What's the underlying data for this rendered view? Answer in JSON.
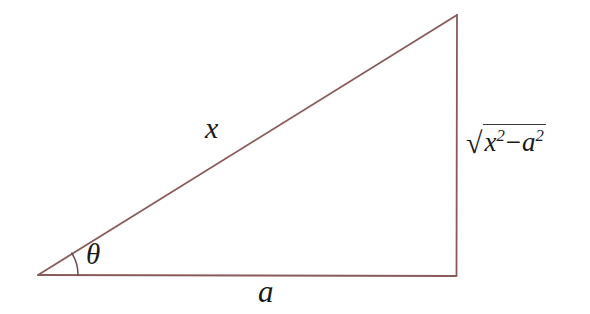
{
  "figure": {
    "name": "right-triangle-trig-substitution",
    "background_color": "#ffffff",
    "line_color": "#8a5a5a",
    "text_color": "#1a1a1a",
    "width": 590,
    "height": 314
  },
  "triangle": {
    "vertices": {
      "left": {
        "x": 38,
        "y": 275
      },
      "bottom_right": {
        "x": 456,
        "y": 276
      },
      "top_right": {
        "x": 457,
        "y": 15
      }
    },
    "angle_arc": {
      "center": {
        "x": 38,
        "y": 275
      },
      "radius": 40,
      "label": "theta"
    }
  },
  "labels": {
    "hypotenuse": "x",
    "base": "a",
    "angle": "θ",
    "opposite": {
      "radical_sign": "√",
      "first_term": "x",
      "first_exponent": "2",
      "operator": "−",
      "second_term": "a",
      "second_exponent": "2",
      "plain": "√(x² − a²)"
    }
  }
}
